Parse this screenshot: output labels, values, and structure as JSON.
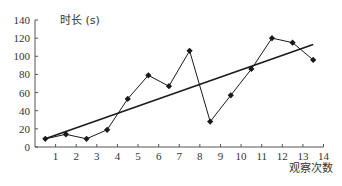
{
  "chart_data": {
    "type": "line",
    "title": "",
    "xlabel": "观察次数",
    "ylabel": "时长 (s)",
    "xlim": [
      0,
      14
    ],
    "ylim": [
      0,
      140
    ],
    "x_ticks": [
      1,
      2,
      3,
      4,
      5,
      6,
      7,
      8,
      9,
      10,
      11,
      12,
      13,
      14
    ],
    "y_ticks": [
      0,
      20,
      40,
      60,
      80,
      100,
      120,
      140
    ],
    "grid": false,
    "legend": null,
    "series": [
      {
        "name": "观测值",
        "style": "line-with-markers",
        "x": [
          0.5,
          1.5,
          2.5,
          3.5,
          4.5,
          5.5,
          6.5,
          7.5,
          8.5,
          9.5,
          10.5,
          11.5,
          12.5,
          13.5
        ],
        "values": [
          9,
          14,
          9,
          19,
          53,
          79,
          67,
          106,
          28,
          57,
          86,
          120,
          115,
          96
        ]
      },
      {
        "name": "趋势线",
        "style": "line",
        "x": [
          0.5,
          13.5
        ],
        "values": [
          9,
          113
        ]
      }
    ]
  },
  "colors": {
    "line": "#1a1a1a",
    "axis": "#555555",
    "text": "#333333"
  }
}
